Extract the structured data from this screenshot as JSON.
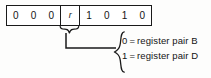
{
  "diagram": {
    "bitfield": {
      "name": "instruction-byte",
      "cells": [
        {
          "value": "0",
          "kind": "bit"
        },
        {
          "value": "0",
          "kind": "bit"
        },
        {
          "value": "0",
          "kind": "bit"
        },
        {
          "value": "r",
          "kind": "field"
        },
        {
          "value": "1",
          "kind": "bit"
        },
        {
          "value": "0",
          "kind": "bit"
        },
        {
          "value": "1",
          "kind": "bit"
        },
        {
          "value": "0",
          "kind": "bit"
        }
      ]
    },
    "callout": {
      "brace_icon": "curly-brace-left-icon",
      "field_brace_icon": "curly-brace-down-icon",
      "leader_icon": "leader-line-icon",
      "entries": [
        {
          "value": "0",
          "equals": "=",
          "description": "register pair B"
        },
        {
          "value": "1",
          "equals": "=",
          "description": "register pair D"
        }
      ]
    },
    "colors": {
      "ink": "#141414",
      "rule": "#1a1a1a",
      "background": "#fdfdfc"
    }
  }
}
